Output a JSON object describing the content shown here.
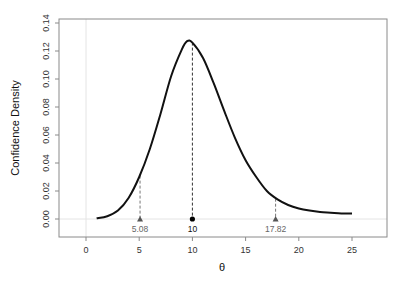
{
  "chart_data": {
    "type": "line",
    "title": "",
    "xlabel": "θ",
    "ylabel": "Confidence Density",
    "xlim": [
      -3,
      28
    ],
    "ylim": [
      -0.012,
      0.14
    ],
    "x_ticks": [
      0,
      5,
      10,
      15,
      20,
      25
    ],
    "y_ticks": [
      0.0,
      0.02,
      0.04,
      0.06,
      0.08,
      0.1,
      0.12,
      0.14
    ],
    "y_tick_labels": [
      "0.00",
      "0.02",
      "0.04",
      "0.06",
      "0.08",
      "0.10",
      "0.12",
      "0.14"
    ],
    "grid": false,
    "reference_lines": {
      "x": 0,
      "y": 0
    },
    "series": [
      {
        "name": "confidence density",
        "x": [
          1,
          2,
          3,
          4,
          5,
          6,
          7,
          8,
          9,
          9.5,
          10,
          11,
          12,
          13,
          14,
          15,
          16,
          17,
          18,
          19,
          20,
          21,
          22,
          23,
          24,
          25
        ],
        "y": [
          0.0005,
          0.002,
          0.006,
          0.015,
          0.03,
          0.05,
          0.075,
          0.102,
          0.121,
          0.127,
          0.126,
          0.115,
          0.097,
          0.077,
          0.058,
          0.042,
          0.03,
          0.02,
          0.014,
          0.01,
          0.0075,
          0.006,
          0.005,
          0.0045,
          0.004,
          0.004
        ]
      }
    ],
    "annotations": [
      {
        "label": "5.08",
        "x": 5.08,
        "marker": "triangle",
        "line_top": 0.031,
        "color": "#666666"
      },
      {
        "label": "10",
        "x": 10,
        "marker": "circle",
        "line_top": 0.126,
        "color": "#111111"
      },
      {
        "label": "17.82",
        "x": 17.82,
        "marker": "triangle",
        "line_top": 0.0145,
        "color": "#666666"
      }
    ]
  },
  "colors": {
    "curve": "#111111",
    "axis": "#8a8a8a",
    "reference_line": "#e4e4e4",
    "ci_marker": "#555555",
    "point_marker": "#000000"
  }
}
